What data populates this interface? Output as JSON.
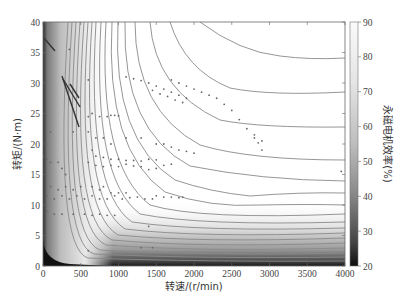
{
  "chart_data": {
    "type": "heatmap",
    "subtype": "efficiency contour map with operating-point scatter",
    "title": "",
    "xlabel": "转速/(r/min)",
    "ylabel": "转矩/(N·m)",
    "colorbar_label": "永磁电机效率(%)",
    "xlim": [
      0,
      4000
    ],
    "ylim": [
      0,
      40
    ],
    "clim": [
      20,
      90
    ],
    "x_ticks": [
      0,
      500,
      1000,
      1500,
      2000,
      2500,
      3000,
      3500,
      4000
    ],
    "y_ticks": [
      0,
      5,
      10,
      15,
      20,
      25,
      30,
      35,
      40
    ],
    "colorbar_ticks": [
      20,
      30,
      40,
      50,
      60,
      70,
      80,
      90
    ],
    "colormap": "grayscale (dark = low efficiency, white = high efficiency)",
    "grid": false,
    "contour_levels_labeled_approx": [
      {
        "level": 80,
        "y_at_4000rpm": 35.5
      },
      {
        "level": 70,
        "y_at_4000rpm": 28.5
      },
      {
        "level": 60,
        "y_at_4000rpm": 21.5
      },
      {
        "level": 50,
        "y_at_4000rpm": 17
      },
      {
        "level": 45,
        "y_at_4000rpm": 13
      },
      {
        "level": 40,
        "y_at_4000rpm": 10.2
      },
      {
        "level": 35,
        "y_at_4000rpm": 8.5
      }
    ],
    "scatter_series": [
      {
        "name": "operating points",
        "points": [
          [
            350,
            35.5
          ],
          [
            600,
            30.5
          ],
          [
            1100,
            31
          ],
          [
            1200,
            30.7
          ],
          [
            1300,
            30.4
          ],
          [
            1400,
            30
          ],
          [
            1500,
            29.5
          ],
          [
            1600,
            29
          ],
          [
            1700,
            28.5
          ],
          [
            1800,
            28
          ],
          [
            1900,
            27.5
          ],
          [
            1700,
            30.5
          ],
          [
            1800,
            30
          ],
          [
            1900,
            29.5
          ],
          [
            2000,
            29
          ],
          [
            2100,
            28.5
          ],
          [
            2200,
            28
          ],
          [
            2300,
            27.5
          ],
          [
            2400,
            26.5
          ],
          [
            2500,
            25.5
          ],
          [
            2600,
            24
          ],
          [
            2700,
            22.5
          ],
          [
            2800,
            21
          ],
          [
            2850,
            20.2
          ],
          [
            2900,
            19
          ],
          [
            1450,
            28.8
          ],
          [
            1550,
            28.2
          ],
          [
            1650,
            27.8
          ],
          [
            1750,
            27.2
          ],
          [
            1850,
            26.8
          ],
          [
            600,
            24.5
          ],
          [
            650,
            25
          ],
          [
            750,
            24.5
          ],
          [
            850,
            24.5
          ],
          [
            900,
            24.7
          ],
          [
            950,
            24.7
          ],
          [
            1000,
            24.6
          ],
          [
            100,
            22
          ],
          [
            400,
            22
          ],
          [
            600,
            22
          ],
          [
            700,
            21
          ],
          [
            800,
            21
          ],
          [
            900,
            20
          ],
          [
            1100,
            21
          ],
          [
            1300,
            21
          ],
          [
            1500,
            20
          ],
          [
            1600,
            20
          ],
          [
            1700,
            19.5
          ],
          [
            1800,
            19
          ],
          [
            1900,
            18.8
          ],
          [
            2000,
            18.5
          ],
          [
            650,
            19
          ],
          [
            700,
            18
          ],
          [
            800,
            17.8
          ],
          [
            900,
            17.5
          ],
          [
            1000,
            17.5
          ],
          [
            1100,
            17.3
          ],
          [
            1200,
            17.3
          ],
          [
            1300,
            17.2
          ],
          [
            1400,
            17.5
          ],
          [
            1500,
            17.4
          ],
          [
            1600,
            16.5
          ],
          [
            1700,
            16.7
          ],
          [
            600,
            17
          ],
          [
            700,
            16.5
          ],
          [
            800,
            16.3
          ],
          [
            900,
            16.5
          ],
          [
            1000,
            16.3
          ],
          [
            1100,
            16.7
          ],
          [
            1200,
            16.4
          ],
          [
            1300,
            16.3
          ],
          [
            1400,
            15.8
          ],
          [
            1500,
            16
          ],
          [
            0,
            18
          ],
          [
            50,
            17.5
          ],
          [
            100,
            17
          ],
          [
            200,
            17
          ],
          [
            250,
            16
          ],
          [
            300,
            15
          ],
          [
            100,
            13
          ],
          [
            200,
            12.5
          ],
          [
            300,
            13
          ],
          [
            400,
            12.5
          ],
          [
            500,
            13
          ],
          [
            650,
            13
          ],
          [
            750,
            12.5
          ],
          [
            800,
            13
          ],
          [
            900,
            12
          ],
          [
            1000,
            12
          ],
          [
            1100,
            12
          ],
          [
            50,
            11.5
          ],
          [
            150,
            11
          ],
          [
            250,
            11.5
          ],
          [
            350,
            11
          ],
          [
            450,
            11.5
          ],
          [
            550,
            11
          ],
          [
            650,
            11.5
          ],
          [
            750,
            11
          ],
          [
            850,
            11
          ],
          [
            950,
            11.5
          ],
          [
            1050,
            11
          ],
          [
            1150,
            11.2
          ],
          [
            1250,
            11.3
          ],
          [
            1350,
            11
          ],
          [
            1450,
            11
          ],
          [
            1500,
            11.5
          ],
          [
            1600,
            11.3
          ],
          [
            1700,
            11.3
          ],
          [
            1800,
            11.2
          ],
          [
            1850,
            11.3
          ],
          [
            50,
            9
          ],
          [
            150,
            8.5
          ],
          [
            250,
            8.5
          ],
          [
            400,
            8.5
          ],
          [
            550,
            8.5
          ],
          [
            650,
            8.3
          ],
          [
            750,
            8.5
          ],
          [
            850,
            8.3
          ],
          [
            950,
            8.3
          ],
          [
            1400,
            6.5
          ],
          [
            1300,
            3
          ],
          [
            1450,
            3
          ],
          [
            600,
            2.5
          ],
          [
            2900,
            20.5
          ],
          [
            2800,
            21.5
          ],
          [
            3950,
            15.5
          ]
        ]
      },
      {
        "name": "low-speed high-torque traces",
        "lines": [
          [
            [
              0,
              40
            ],
            [
              150,
              34.5
            ]
          ],
          [
            [
              300,
              31
            ],
            [
              550,
              23
            ]
          ],
          [
            [
              300,
              30.5
            ],
            [
              600,
              26
            ]
          ],
          [
            [
              400,
              29
            ],
            [
              600,
              28
            ]
          ]
        ]
      }
    ]
  }
}
